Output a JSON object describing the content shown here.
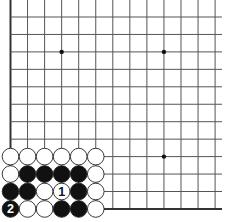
{
  "board": {
    "description": "Go board corner diagram (lower-left corner)",
    "grid": {
      "origin_x": 10.5,
      "origin_y": 17,
      "spacing_x": 17.05,
      "spacing_y": 17.45,
      "cols": 13,
      "rows": 12,
      "right_extent": 222,
      "top_extent": 0,
      "edges": [
        "left",
        "bottom"
      ]
    },
    "colors": {
      "background": "#ffffff",
      "line": "#555555",
      "edge_line": "#333333",
      "black_stone": "#111111",
      "white_stone": "#ffffff",
      "stone_outline": "#222222"
    },
    "star_points": [
      {
        "col": 3,
        "row": 2
      },
      {
        "col": 9,
        "row": 2
      },
      {
        "col": 9,
        "row": 8
      }
    ],
    "stones": [
      {
        "col": 0,
        "row": 8,
        "color": "white"
      },
      {
        "col": 1,
        "row": 8,
        "color": "white"
      },
      {
        "col": 2,
        "row": 8,
        "color": "white"
      },
      {
        "col": 3,
        "row": 8,
        "color": "white"
      },
      {
        "col": 4,
        "row": 8,
        "color": "white"
      },
      {
        "col": 5,
        "row": 8,
        "color": "white"
      },
      {
        "col": 0,
        "row": 9,
        "color": "white"
      },
      {
        "col": 1,
        "row": 9,
        "color": "black"
      },
      {
        "col": 2,
        "row": 9,
        "color": "black"
      },
      {
        "col": 3,
        "row": 9,
        "color": "black"
      },
      {
        "col": 4,
        "row": 9,
        "color": "black"
      },
      {
        "col": 5,
        "row": 9,
        "color": "white"
      },
      {
        "col": 0,
        "row": 10,
        "color": "black"
      },
      {
        "col": 1,
        "row": 10,
        "color": "black"
      },
      {
        "col": 2,
        "row": 10,
        "color": "white"
      },
      {
        "col": 3,
        "row": 10,
        "color": "white",
        "label": "1"
      },
      {
        "col": 4,
        "row": 10,
        "color": "black"
      },
      {
        "col": 5,
        "row": 10,
        "color": "white"
      },
      {
        "col": 0,
        "row": 11,
        "color": "black",
        "label": "2"
      },
      {
        "col": 1,
        "row": 11,
        "color": "white"
      },
      {
        "col": 2,
        "row": 11,
        "color": "white"
      },
      {
        "col": 3,
        "row": 11,
        "color": "black"
      },
      {
        "col": 4,
        "row": 11,
        "color": "black"
      },
      {
        "col": 5,
        "row": 11,
        "color": "white"
      }
    ],
    "move_labels": [
      "1",
      "2"
    ]
  }
}
